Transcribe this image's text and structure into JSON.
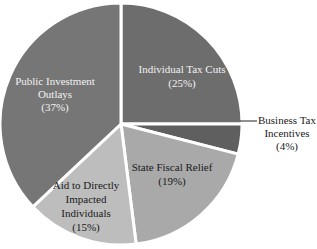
{
  "chart_data": {
    "type": "pie",
    "title": "",
    "start_angle_deg": 0,
    "direction": "clockwise",
    "slices": [
      {
        "label": "Individual Tax Cuts",
        "value": 25,
        "pct_label": "(25%)",
        "color": "#6d6d6d"
      },
      {
        "label": "Business Tax Incentives",
        "value": 4,
        "pct_label": "(4%)",
        "color": "#5f5f5f"
      },
      {
        "label": "State Fiscal Relief",
        "value": 19,
        "pct_label": "(19%)",
        "color": "#a9a9a9"
      },
      {
        "label": "Aid to Directly Impacted Individuals",
        "value": 15,
        "pct_label": "(15%)",
        "color": "#bdbdbd"
      },
      {
        "label": "Public Investment Outlays",
        "value": 37,
        "pct_label": "(37%)",
        "color": "#767676"
      }
    ]
  },
  "labels": {
    "individual": {
      "line1": "Individual Tax Cuts",
      "line2": "(25%)"
    },
    "business": {
      "line1": "Business Tax",
      "line2": "Incentives",
      "line3": "(4%)"
    },
    "state": {
      "line1": "State Fiscal Relief",
      "line2": "(19%)"
    },
    "aid": {
      "line1": "Aid to Directly",
      "line2": "Impacted",
      "line3": "Individuals",
      "line4": "(15%)"
    },
    "public": {
      "line1": "Public Investment",
      "line2": "Outlays",
      "line3": "(37%)"
    }
  }
}
